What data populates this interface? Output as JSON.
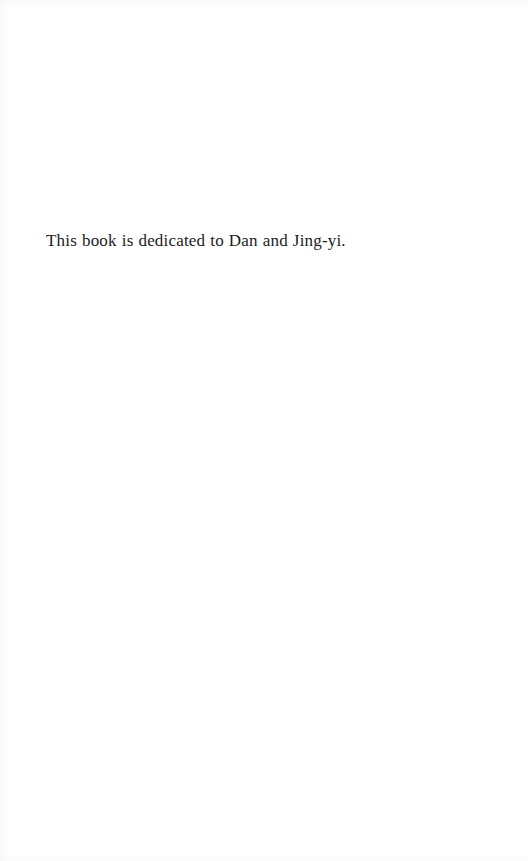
{
  "page": {
    "kind": "book-dedication-page",
    "background_color": "#ffffff",
    "text_color": "#1b1b1f",
    "page_number": "",
    "header": "",
    "footer": ""
  },
  "dedication": {
    "text": "This book is dedicated to Dan and Jing-yi."
  }
}
